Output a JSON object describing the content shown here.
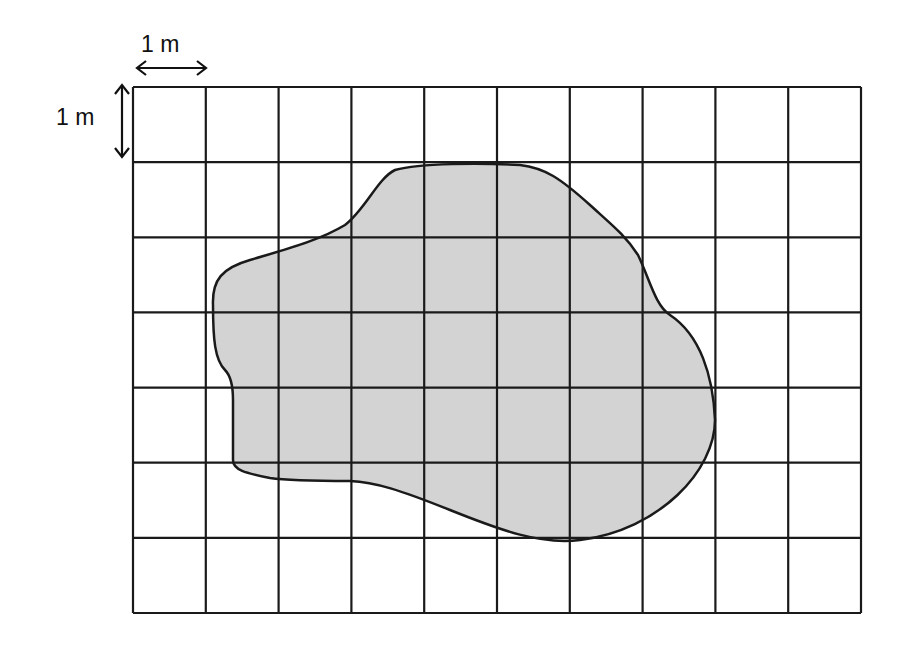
{
  "diagram": {
    "type": "area-estimation-grid",
    "grid": {
      "columns": 10,
      "rows": 7,
      "left": 133,
      "top": 87,
      "right": 861,
      "bottom": 613,
      "line_color": "#1a1a1a"
    },
    "scale": {
      "horizontal_label": "1 m",
      "vertical_label": "1 m"
    },
    "shape": {
      "fill": "#d3d3d3",
      "stroke": "#1a1a1a",
      "path": "M 213 305 C 212 280 222 268 250 260 C 290 248 320 240 345 225 C 365 210 378 178 395 170 C 420 163 480 163 520 165 C 545 168 560 178 590 205 C 612 225 625 235 638 255 C 650 280 655 305 670 315 C 700 335 713 375 715 420 C 715 470 660 530 580 540 C 540 545 500 530 450 510 C 400 490 375 482 350 481 C 320 481 290 481 270 478 C 245 473 233 470 233 460 L 233 400 C 233 385 230 375 225 370 C 215 360 213 340 213 305 Z"
    }
  }
}
